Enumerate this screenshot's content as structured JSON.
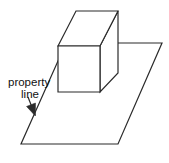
{
  "figure": {
    "background_color": "#ffffff",
    "line_color": "#2b2b2b",
    "fill_color": "#ffffff",
    "text_color": "#111111",
    "stroke_width": 1.2,
    "width": 169,
    "height": 163
  },
  "annotation": {
    "label_line1": "property",
    "label_line2": "line",
    "label_x": 8,
    "label_y": 86,
    "arrow": {
      "from_x": 28,
      "from_y": 97,
      "to_x": 35,
      "to_y": 115,
      "head_size": 5
    }
  },
  "ground_plane": {
    "name": "property-plot-parallelogram",
    "points": [
      {
        "x": 66,
        "y": 43
      },
      {
        "x": 162,
        "y": 43
      },
      {
        "x": 118,
        "y": 144
      },
      {
        "x": 21,
        "y": 144
      }
    ]
  },
  "box": {
    "name": "building-box",
    "front_face": [
      {
        "x": 58,
        "y": 46
      },
      {
        "x": 100,
        "y": 46
      },
      {
        "x": 100,
        "y": 92
      },
      {
        "x": 58,
        "y": 92
      }
    ],
    "top_face": [
      {
        "x": 58,
        "y": 46
      },
      {
        "x": 76,
        "y": 11
      },
      {
        "x": 118,
        "y": 11
      },
      {
        "x": 100,
        "y": 46
      }
    ],
    "right_face": [
      {
        "x": 100,
        "y": 46
      },
      {
        "x": 118,
        "y": 11
      },
      {
        "x": 118,
        "y": 73
      },
      {
        "x": 100,
        "y": 92
      }
    ]
  }
}
